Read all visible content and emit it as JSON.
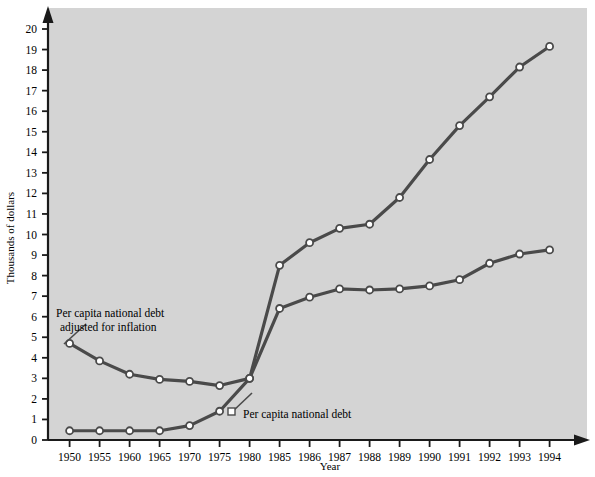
{
  "chart_data": {
    "type": "line",
    "title": "",
    "xlabel": "Year",
    "ylabel": "Thousands of dollars",
    "x": [
      1950,
      1955,
      1960,
      1965,
      1970,
      1975,
      1980,
      1985,
      1986,
      1987,
      1988,
      1989,
      1990,
      1991,
      1992,
      1993,
      1994
    ],
    "xtick_labels": [
      "1950",
      "1955",
      "1960",
      "1965",
      "1970",
      "1975",
      "1980",
      "1985",
      "1986",
      "1987",
      "1988",
      "1989",
      "1990",
      "1991",
      "1992",
      "1993",
      "1994"
    ],
    "ytick_labels": [
      "0",
      "1",
      "2",
      "3",
      "4",
      "5",
      "6",
      "7",
      "8",
      "9",
      "10",
      "11",
      "12",
      "13",
      "14",
      "15",
      "16",
      "17",
      "18",
      "19",
      "20"
    ],
    "ylim": [
      0,
      20
    ],
    "grid": false,
    "legend_position": "inline-annotations",
    "series": [
      {
        "name": "Per capita national debt",
        "values": [
          0.45,
          0.45,
          0.45,
          0.45,
          0.7,
          1.4,
          3.0,
          8.5,
          9.6,
          10.3,
          10.5,
          11.8,
          13.65,
          15.3,
          16.7,
          18.15,
          19.15
        ],
        "marker": "circle",
        "color": "#4a4a4a"
      },
      {
        "name": "Per capita national debt adjusted for inflation",
        "values": [
          4.7,
          3.85,
          3.2,
          2.95,
          2.85,
          2.65,
          3.0,
          6.4,
          6.95,
          7.35,
          7.3,
          7.35,
          7.5,
          7.8,
          8.6,
          9.05,
          9.25
        ],
        "marker": "circle",
        "color": "#4a4a4a"
      }
    ],
    "annotations": [
      {
        "id": "annotation-adjusted",
        "line1": "Per capita national debt",
        "line2": "adjusted for inflation",
        "points_to_year": 1950
      },
      {
        "id": "annotation-nominal",
        "line1": "Per capita national debt",
        "points_to_year": 1975
      }
    ],
    "colors": {
      "plot_background": "#d4d4d4",
      "axis": "#1a1a1a",
      "line": "#4a4a4a",
      "marker_fill": "#ffffff",
      "page_background": "#ffffff"
    }
  }
}
